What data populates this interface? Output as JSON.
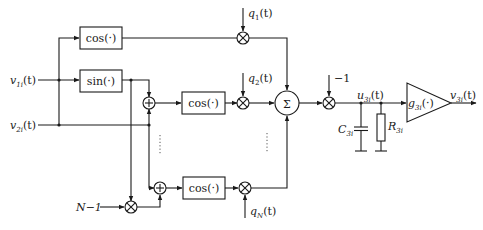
{
  "diagram": {
    "type": "signal-flow block diagram",
    "inputs": {
      "v1": {
        "sym": "v",
        "sub": "1i",
        "arg": "(t)"
      },
      "v2": {
        "sym": "v",
        "sub": "2i",
        "arg": "(t)"
      },
      "n_minus_1": "N−1"
    },
    "blocks": {
      "cos_top": "cos(·)",
      "sin": "sin(·)",
      "cos_mid": "cos(·)",
      "cos_bottom": "cos(·)",
      "sum": "Σ",
      "plus": "+",
      "times": "×"
    },
    "weights": {
      "q1": {
        "sym": "q",
        "sub": "1",
        "arg": "(t)"
      },
      "q2": {
        "sym": "q",
        "sub": "2",
        "arg": "(t)"
      },
      "qN": {
        "sym": "q",
        "sub": "N",
        "arg": "(t)"
      }
    },
    "minus_one": "−1",
    "node": {
      "sym": "u",
      "sub": "3i",
      "arg": "(t)"
    },
    "capacitor": {
      "sym": "C",
      "sub": "3i"
    },
    "resistor": {
      "sym": "R",
      "sub": "3i"
    },
    "amplifier": {
      "sym": "g",
      "sub": "3i",
      "arg": "(·)"
    },
    "output": {
      "sym": "v",
      "sub": "3i",
      "arg": "(t)"
    },
    "ellipsis": "⋮"
  }
}
